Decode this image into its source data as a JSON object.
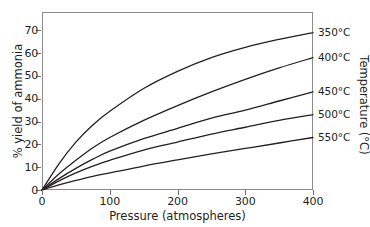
{
  "chart_data": {
    "type": "line",
    "title": "",
    "xlabel": "Pressure (atmospheres)",
    "ylabel": "% yield of ammonia",
    "legend_title": "Temperature (°C)",
    "legend_position": "right",
    "grid": false,
    "xlim": [
      0,
      400
    ],
    "ylim": [
      0,
      78
    ],
    "xticks": [
      0,
      100,
      200,
      300,
      400
    ],
    "xtick_labels": [
      "0",
      "100",
      "200",
      "300",
      "400"
    ],
    "yticks": [
      0,
      10,
      20,
      30,
      40,
      50,
      60,
      70
    ],
    "ytick_labels": [
      "0",
      "10",
      "20",
      "30",
      "40",
      "50",
      "60",
      "70"
    ],
    "x": [
      0,
      25,
      50,
      75,
      100,
      150,
      200,
      250,
      300,
      350,
      400
    ],
    "series": [
      {
        "name": "350°C",
        "label": "350°C",
        "color": "#231f20",
        "values": [
          0,
          11.5,
          21.0,
          28.5,
          34.5,
          44.5,
          52.0,
          58.0,
          62.5,
          66.0,
          69.0
        ]
      },
      {
        "name": "400°C",
        "label": "400°C",
        "color": "#231f20",
        "values": [
          0,
          7.0,
          13.0,
          18.5,
          23.0,
          30.5,
          37.0,
          43.0,
          48.5,
          53.5,
          58.0
        ]
      },
      {
        "name": "450°C",
        "label": "450°C",
        "color": "#231f20",
        "values": [
          0,
          5.0,
          9.5,
          13.5,
          17.0,
          22.5,
          27.0,
          31.5,
          35.0,
          39.0,
          43.0
        ]
      },
      {
        "name": "500°C",
        "label": "500°C",
        "color": "#231f20",
        "values": [
          0,
          4.0,
          7.5,
          10.5,
          13.0,
          17.5,
          21.0,
          24.5,
          27.5,
          30.5,
          33.0
        ]
      },
      {
        "name": "550°C",
        "label": "550°C",
        "color": "#231f20",
        "values": [
          0,
          2.2,
          4.2,
          6.0,
          7.5,
          10.5,
          13.2,
          15.8,
          18.2,
          20.6,
          23.0
        ]
      }
    ]
  },
  "style": {
    "line_color": "#231f20",
    "frame_color": "#8c8c8c",
    "tick_color": "#6e6e6e",
    "background": "#ffffff"
  }
}
